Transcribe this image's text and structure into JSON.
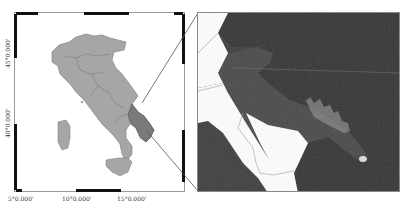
{
  "figure": {
    "overview_map": {
      "x_ticks": [
        "5°0.000'",
        "10°0.000'",
        "15°0.000'"
      ],
      "y_ticks": [
        "45°0.000'",
        "40°0.000'"
      ],
      "land_color": "#a6a6a6",
      "highlight_color": "#7a7a7a",
      "highlight_region": "Puglia"
    },
    "detail_map": {
      "background_color": "#3a3a3a",
      "land_white_color": "#ffffff",
      "description": "Satellite detail of the highlighted region"
    },
    "connector_color": "#555555"
  }
}
